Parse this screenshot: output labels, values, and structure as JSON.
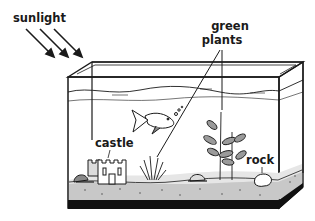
{
  "diagram": {
    "labels": {
      "sunlight": "sunlight",
      "green_plants_line1": "green",
      "green_plants_line2": "plants",
      "castle": "castle",
      "rock": "rock"
    },
    "colors": {
      "stroke": "#1a1a1a",
      "gravel": "#c8c8c8",
      "sand": "#e6e6e6",
      "plant_leaf": "#9a9a9a",
      "base": "#111111",
      "background": "#ffffff"
    }
  }
}
